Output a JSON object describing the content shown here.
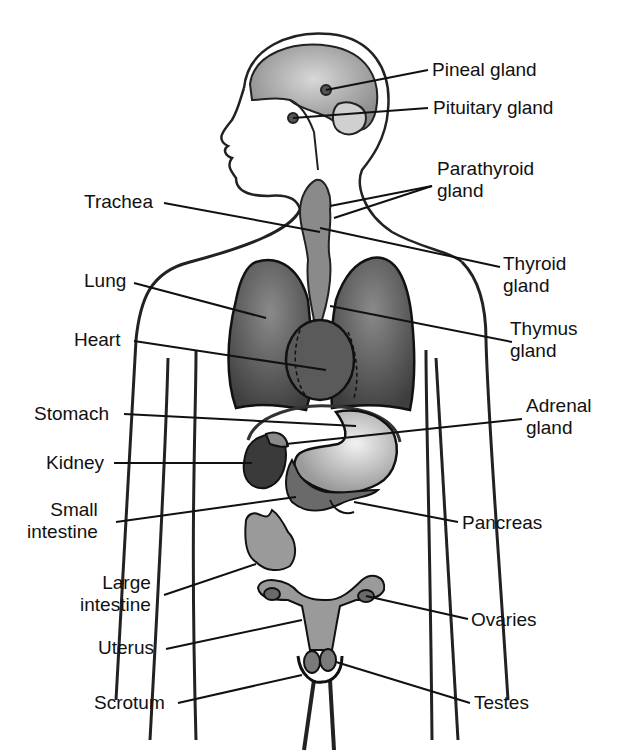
{
  "diagram": {
    "colors": {
      "ink": "#111111",
      "organ_dark": "#4a4a4a",
      "organ_mid": "#7a7a7a",
      "organ_light": "#c8c8c8",
      "background": "#ffffff"
    },
    "labels": {
      "pineal": "Pineal gland",
      "pituitary": "Pituitary gland",
      "parathyroid": "Parathyroid\ngland",
      "trachea": "Trachea",
      "thyroid": "Thyroid\ngland",
      "lung": "Lung",
      "thymus": "Thymus\ngland",
      "heart": "Heart",
      "stomach": "Stomach",
      "adrenal": "Adrenal\ngland",
      "kidney": "Kidney",
      "small_intestine": "Small\nintestine",
      "pancreas": "Pancreas",
      "large_intestine": "Large\nintestine",
      "ovaries": "Ovaries",
      "uterus": "Uterus",
      "scrotum": "Scrotum",
      "testes": "Testes"
    }
  }
}
